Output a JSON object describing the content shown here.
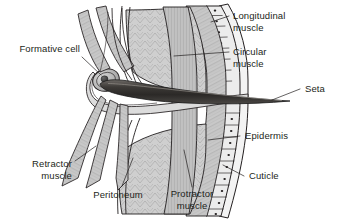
{
  "figure": {
    "background_color": "#ffffff",
    "ink_color": "#231f20",
    "width": 351,
    "height": 222
  },
  "labels": {
    "formative_cell": "Formative cell",
    "longitudinal_muscle_line1": "Longitudinal",
    "longitudinal_muscle_line2": "muscle",
    "circular_muscle_line1": "Circular",
    "circular_muscle_line2": "muscle",
    "seta": "Seta",
    "epidermis": "Epidermis",
    "cuticle": "Cuticle",
    "retractor_muscle_line1": "Retractor",
    "retractor_muscle_line2": "muscle",
    "peritoneum": "Peritoneum",
    "protractor_muscle_line1": "Protractor",
    "protractor_muscle_line2": "muscle"
  },
  "structures": {
    "seta_fill": "#3a3a3a",
    "muscle_fill": "#c9c9c9",
    "epidermis_fill": "#ebebeb",
    "cuticle_fill": "#f5f5f5",
    "formative_cell_fill": "#b8b8b8",
    "nucleus_fill": "#4a4a4a"
  }
}
